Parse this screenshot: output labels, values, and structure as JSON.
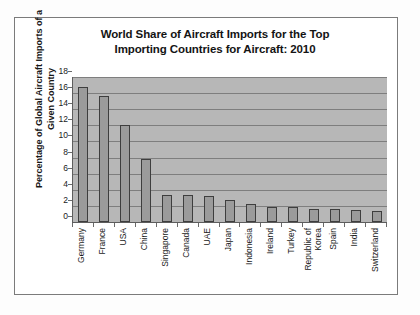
{
  "chart_data": {
    "type": "bar",
    "title": "World Share of Aircraft Imports for the Top Importing Countries for Aircraft: 2010",
    "title_line1": "World Share of Aircraft Imports for the Top",
    "title_line2": "Importing Countries for Aircraft: 2010",
    "xlabel": "",
    "ylabel": "Percentage of Global Aircraft Imports of a Given Country",
    "ylabel_line1": "Percentage of Global Aircraft Imports of a",
    "ylabel_line2": "Given Country",
    "ylim": [
      0,
      18
    ],
    "ytick_step": 2,
    "yticks": [
      "18",
      "16",
      "14",
      "12",
      "10",
      "8",
      "6",
      "4",
      "2",
      "0"
    ],
    "grid": "horizontal",
    "legend": "none",
    "categories": [
      "Germany",
      "France",
      "USA",
      "China",
      "Singapore",
      "Canada",
      "UAE",
      "Japan",
      "Indonesia",
      "Ireland",
      "Turkey",
      "Republic of\nKorea",
      "Spain",
      "India",
      "Switzerland"
    ],
    "values": [
      16.8,
      15.7,
      12.1,
      7.8,
      3.4,
      3.4,
      3.2,
      2.7,
      2.2,
      1.9,
      1.85,
      1.6,
      1.6,
      1.5,
      1.4
    ],
    "colors": {
      "bar_fill": "#9b9b9b",
      "bar_edge": "#3e3e3e",
      "plot_background": "#b7b7b7",
      "gridline": "#7e7e7e",
      "axis": "#5d5d5d",
      "frame": "#7b7b7b",
      "text": "#161616",
      "page_background": "#fdfdfd"
    }
  }
}
